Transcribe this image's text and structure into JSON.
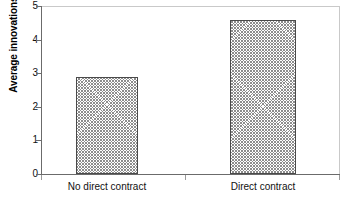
{
  "chart_data": {
    "type": "bar",
    "title": "",
    "xlabel": "",
    "ylabel": "Average innovations per project",
    "categories": [
      "No direct contract",
      "Direct contract"
    ],
    "values": [
      2.88,
      4.58
    ],
    "ylim": [
      0,
      5
    ],
    "yticks": [
      "0",
      "1",
      "2",
      "3",
      "4",
      "5"
    ],
    "ytick_values": [
      0,
      1,
      2,
      3,
      4,
      5
    ],
    "grid": false,
    "legend": null,
    "bar_fill": "cross-hatch",
    "bar_color": "#8d8d8d",
    "axis_color": "#6b6b6b",
    "frame_color": "#c9c9c9",
    "background": "#ffffff"
  },
  "axes": {
    "y_title": "Average innovations per project",
    "ticks": [
      {
        "label": "5",
        "value": 5
      },
      {
        "label": "4",
        "value": 4
      },
      {
        "label": "3",
        "value": 3
      },
      {
        "label": "2",
        "value": 2
      },
      {
        "label": "1",
        "value": 1
      },
      {
        "label": "0",
        "value": 0
      }
    ]
  },
  "bars": [
    {
      "label": "No direct contract",
      "value": 2.88
    },
    {
      "label": "Direct contract",
      "value": 4.58
    }
  ]
}
